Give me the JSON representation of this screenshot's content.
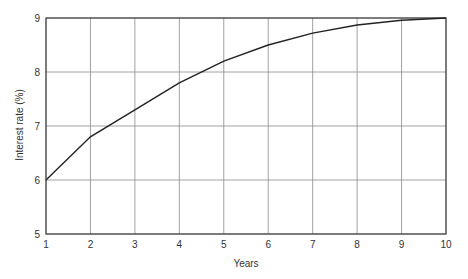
{
  "chart_data": {
    "type": "line",
    "title": "",
    "xlabel": "Years",
    "ylabel": "Interest rate (%)",
    "x": [
      1,
      2,
      3,
      4,
      5,
      6,
      7,
      8,
      9,
      10
    ],
    "series": [
      {
        "name": "Interest rate",
        "values": [
          6.0,
          6.8,
          7.3,
          7.8,
          8.2,
          8.5,
          8.72,
          8.87,
          8.96,
          9.0
        ]
      }
    ],
    "xlim": [
      1,
      10
    ],
    "ylim": [
      5,
      9
    ],
    "xticks": [
      1,
      2,
      3,
      4,
      5,
      6,
      7,
      8,
      9,
      10
    ],
    "yticks": [
      5,
      6,
      7,
      8,
      9
    ],
    "grid": true,
    "legend": null
  },
  "colors": {
    "line": "#222222",
    "grid": "#8a8a8a",
    "frame": "#444444",
    "text": "#333333"
  }
}
